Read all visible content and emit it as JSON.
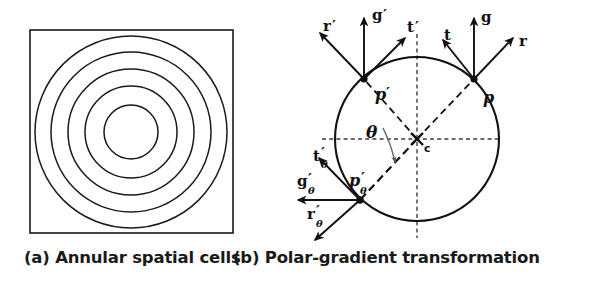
{
  "figure": {
    "panels": [
      {
        "id": "a",
        "caption": "(a) Annular spatial cells",
        "type": "annular-spatial-cells",
        "geometry": {
          "square": {
            "x": 30,
            "y": 30,
            "size": 203
          },
          "center": {
            "x": 131,
            "y": 132
          },
          "circle_radii": [
            27,
            46,
            63,
            80,
            96
          ],
          "circle_count": 5
        },
        "colors": {
          "stroke": "#1a1a1a",
          "fill": "#ffffff"
        }
      },
      {
        "id": "b",
        "caption": "(b) Polar-gradient transformation",
        "type": "polar-gradient-transformation",
        "geometry": {
          "center": {
            "x": 122,
            "y": 139,
            "label": "c"
          },
          "circle_radius": 82,
          "dashed_axes": {
            "h_from": 27,
            "h_to": 207,
            "v_from": 34,
            "v_to": 238
          },
          "theta_label": "θ"
        },
        "points": [
          {
            "name": "p",
            "label": "p",
            "prime": false,
            "subscript": "",
            "at": {
              "x": 179,
              "y": 79
            },
            "vectors": [
              {
                "name": "g",
                "label": "g",
                "prime": false,
                "subscript": "",
                "to": {
                  "x": 179,
                  "y": 18
                }
              },
              {
                "name": "r",
                "label": "r",
                "prime": false,
                "subscript": "",
                "to": {
                  "x": 218,
                  "y": 38
                }
              },
              {
                "name": "t",
                "label": "t",
                "prime": false,
                "subscript": "",
                "to": {
                  "x": 148,
                  "y": 40
                }
              }
            ]
          },
          {
            "name": "p-prime",
            "label": "p",
            "prime": true,
            "subscript": "",
            "at": {
              "x": 69,
              "y": 79
            },
            "vectors": [
              {
                "name": "g-prime",
                "label": "g",
                "prime": true,
                "subscript": "",
                "to": {
                  "x": 69,
                  "y": 18
                }
              },
              {
                "name": "t-prime",
                "label": "t",
                "prime": true,
                "subscript": "",
                "to": {
                  "x": 110,
                  "y": 38
                }
              },
              {
                "name": "r-prime",
                "label": "r",
                "prime": true,
                "subscript": "",
                "to": {
                  "x": 25,
                  "y": 33
                }
              }
            ]
          },
          {
            "name": "p-prime-theta",
            "label": "p",
            "prime": true,
            "subscript": "θ",
            "at": {
              "x": 65,
              "y": 200
            },
            "vectors": [
              {
                "name": "g-prime-theta",
                "label": "g",
                "prime": true,
                "subscript": "θ",
                "to": {
                  "x": 3,
                  "y": 200
                }
              },
              {
                "name": "t-prime-theta",
                "label": "t",
                "prime": true,
                "subscript": "θ",
                "to": {
                  "x": 24,
                  "y": 158
                }
              },
              {
                "name": "r-prime-theta",
                "label": "r",
                "prime": true,
                "subscript": "θ",
                "to": {
                  "x": 20,
                  "y": 240
                }
              }
            ]
          }
        ],
        "radial_dashes": [
          {
            "name": "c-to-p",
            "from": {
              "x": 122,
              "y": 139
            },
            "to": {
              "x": 179,
              "y": 79
            }
          },
          {
            "name": "c-to-p-prime",
            "from": {
              "x": 122,
              "y": 139
            },
            "to": {
              "x": 69,
              "y": 79
            }
          },
          {
            "name": "c-to-p-prime-theta",
            "from": {
              "x": 122,
              "y": 139
            },
            "to": {
              "x": 65,
              "y": 200
            }
          }
        ],
        "colors": {
          "stroke": "#1a1a1a",
          "dashed": "#3a3a3a"
        }
      }
    ]
  }
}
